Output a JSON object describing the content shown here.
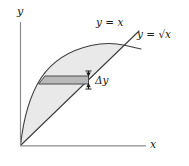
{
  "figure": {
    "axes": {
      "y_label": "y",
      "x_label": "x",
      "axis_color": "#8c8c8c"
    },
    "curves": [
      {
        "name": "line",
        "label_math": "y = x",
        "label_lhs": "y",
        "label_eq": " = ",
        "label_rhs": "x",
        "color": "#3a3a3a"
      },
      {
        "name": "sqrt-curve",
        "label_math": "y = √x",
        "label_lhs": "y",
        "label_eq": " = ",
        "label_rhs": "√x",
        "color": "#3a3a3a"
      }
    ],
    "region": {
      "name": "area-between-curves",
      "fill_color": "#e8e8e8"
    },
    "strip": {
      "name": "delta-y-strip",
      "label": "Δy",
      "label_delta": "Δ",
      "label_var": "y",
      "fill_color": "#b8b8b8",
      "edge_color": "#4a4a4a"
    },
    "dimension_marker": {
      "name": "delta-y-arrow",
      "color": "#1a1a1a"
    }
  }
}
